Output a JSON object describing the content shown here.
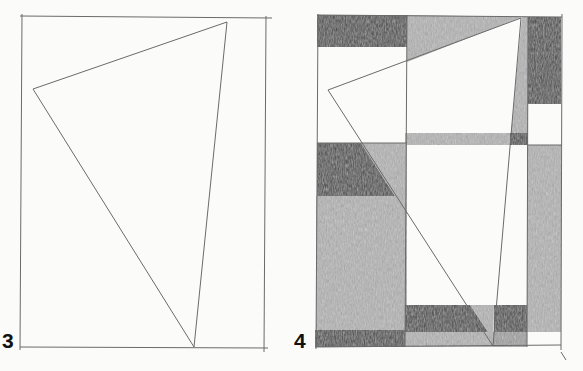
{
  "figure": {
    "panels": [
      {
        "label": "3",
        "description": "Pencil rectangle frame with a thin outlined triangle"
      },
      {
        "label": "4",
        "description": "Same frame and triangle subdivided into a grid of shaded pencil blocks"
      }
    ]
  },
  "colors": {
    "paper": "#fbfbfa",
    "line": "#6a6a6a",
    "dark_shade": "#474747",
    "light_shade": "#b4b4b4",
    "mid_shade": "#8c8c8c"
  }
}
